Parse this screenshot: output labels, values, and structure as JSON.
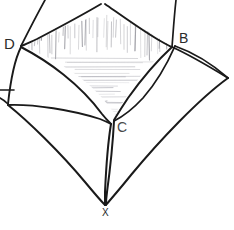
{
  "figure": {
    "background_color": "#ffffff",
    "ink_color": "#1a1a1a",
    "hatch_color": "#8c8c94",
    "light_hatch_color": "#a8a8b0"
  },
  "labels": {
    "d": "D",
    "b": "B",
    "c": "C",
    "x": "X"
  },
  "vertices": {
    "apex_top": {
      "name": "top-apex",
      "x": 103,
      "y": 3
    },
    "d": {
      "name": "D",
      "x": 21,
      "y": 46
    },
    "b": {
      "name": "B",
      "x": 172,
      "y": 47
    },
    "left": {
      "name": "left-cusp",
      "x": 8,
      "y": 105
    },
    "right": {
      "name": "right-cusp",
      "x": 228,
      "y": 78
    },
    "c": {
      "name": "C",
      "x": 113,
      "y": 120
    },
    "x": {
      "name": "X",
      "x": 106,
      "y": 205
    }
  },
  "shading": {
    "vertical_hatch_count": 46,
    "horizontal_hatch_count": 22,
    "region": "upper-interior-quadrilateral"
  }
}
